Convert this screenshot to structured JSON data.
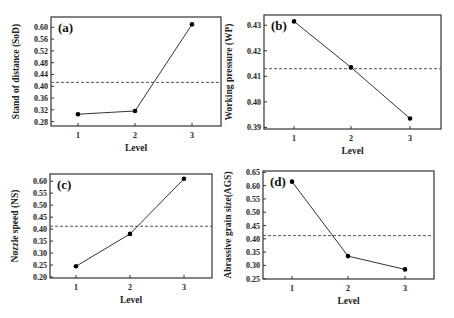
{
  "chart_data": [
    {
      "type": "line",
      "panel": "(a)",
      "xlabel": "Level",
      "ylabel": "Stand of distance (SoD)",
      "categories": [
        1,
        2,
        3
      ],
      "values": [
        0.305,
        0.316,
        0.61
      ],
      "mean_line": 0.413,
      "yticks": [
        "0.28",
        "0.32",
        "0.36",
        "0.40",
        "0.44",
        "0.48",
        "0.52",
        "0.56",
        "0.60"
      ],
      "ylim": [
        0.265,
        0.635
      ],
      "frame": {
        "x0": 51,
        "x1": 221,
        "y0": 17,
        "y1": 126
      },
      "xpos": [
        78,
        135,
        192
      ]
    },
    {
      "type": "line",
      "panel": "(b)",
      "xlabel": "Level",
      "ylabel": "Working pressure (WP)",
      "categories": [
        1,
        2,
        3
      ],
      "values": [
        0.4315,
        0.4135,
        0.3935
      ],
      "mean_line": 0.413,
      "yticks": [
        "0.39",
        "0.40",
        "0.41",
        "0.42",
        "0.43"
      ],
      "ylim": [
        0.3894,
        0.434
      ],
      "frame": {
        "x0": 264,
        "x1": 441,
        "y0": 15,
        "y1": 129
      },
      "xpos": [
        294,
        351,
        410
      ]
    },
    {
      "type": "line",
      "panel": "(c)",
      "xlabel": "Level",
      "ylabel": "Nozzle speed (NS)",
      "categories": [
        1,
        2,
        3
      ],
      "values": [
        0.245,
        0.38,
        0.61
      ],
      "mean_line": 0.412,
      "yticks": [
        "0.20",
        "0.25",
        "0.30",
        "0.35",
        "0.40",
        "0.45",
        "0.50",
        "0.55",
        "0.60"
      ],
      "ylim": [
        0.196,
        0.63
      ],
      "frame": {
        "x0": 50,
        "x1": 212,
        "y0": 174,
        "y1": 278
      },
      "xpos": [
        76,
        130,
        184
      ]
    },
    {
      "type": "line",
      "panel": "(d)",
      "xlabel": "Level",
      "ylabel": "Abrassive grain size(AGS)",
      "categories": [
        1,
        2,
        3
      ],
      "values": [
        0.615,
        0.335,
        0.285
      ],
      "mean_line": 0.412,
      "yticks": [
        "0.25",
        "0.30",
        "0.35",
        "0.40",
        "0.45",
        "0.50",
        "0.55",
        "0.60",
        "0.65"
      ],
      "ylim": [
        0.249,
        0.655
      ],
      "frame": {
        "x0": 263,
        "x1": 434,
        "y0": 171,
        "y1": 279
      },
      "xpos": [
        292,
        348,
        405
      ]
    }
  ],
  "colors": {
    "line": "#333333",
    "marker": "#000000",
    "frame": "#333333",
    "dashed": "#555555"
  }
}
